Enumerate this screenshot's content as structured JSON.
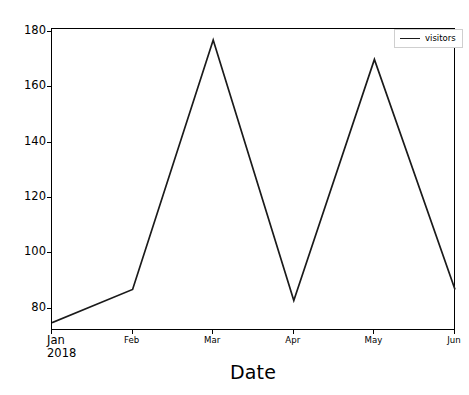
{
  "chart_data": {
    "type": "line",
    "title": "",
    "subtitle": "",
    "xlabel": "Date",
    "ylabel": "",
    "categories": [
      "Jan\n2018",
      "Feb",
      "Mar",
      "Apr",
      "May",
      "Jun"
    ],
    "x_tick_labels": [
      "Jan\n2018",
      "Feb",
      "Mar",
      "Apr",
      "May",
      "Jun"
    ],
    "y_tick_labels": [
      "80",
      "100",
      "120",
      "140",
      "160",
      "180"
    ],
    "y_ticks": [
      80,
      100,
      120,
      140,
      160,
      180
    ],
    "ylim": [
      72,
      181
    ],
    "xlim": [
      0,
      5
    ],
    "grid": false,
    "legend_position": "upper right",
    "series": [
      {
        "name": "visitors",
        "color": "#1a1a1a",
        "values": [
          75,
          87,
          177,
          83,
          170,
          87
        ]
      }
    ]
  },
  "legend": {
    "entries": [
      {
        "label": "visitors"
      }
    ]
  },
  "axes": {
    "x_title": "Date"
  }
}
